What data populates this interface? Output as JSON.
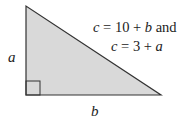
{
  "diagram": {
    "type": "right-triangle",
    "colors": {
      "fill": "#d9d9d9",
      "stroke": "#333333",
      "text": "#222222"
    },
    "vertical_side_label": "a",
    "horizontal_side_label": "b",
    "equations": {
      "line1": {
        "var": "c",
        "op": "=",
        "const": "10",
        "plus": "+",
        "term": "b",
        "suffix": "and"
      },
      "line2": {
        "var": "c",
        "op": "=",
        "const": "3",
        "plus": "+",
        "term": "a"
      }
    }
  }
}
